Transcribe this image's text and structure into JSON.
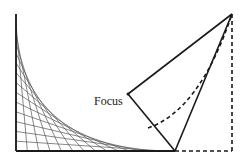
{
  "diagram": {
    "title": "",
    "type": "parabola-envelope-construction",
    "labels": {
      "focus": "Focus"
    },
    "colors": {
      "line": "#1a1a1a",
      "string": "#555555",
      "background": "#ffffff"
    },
    "points": {
      "left_top": [
        16,
        14
      ],
      "origin": [
        16,
        151
      ],
      "base_solid_end": [
        175,
        151
      ],
      "apex": [
        232,
        14
      ],
      "right_bottom": [
        232,
        151
      ],
      "focus": [
        128,
        94
      ]
    },
    "string_art": {
      "count": 14,
      "left_axis": {
        "x": 16,
        "y_top": 14,
        "y_bottom": 151
      },
      "bottom_axis": {
        "y": 151,
        "x_left": 16,
        "x_right": 175
      }
    }
  }
}
